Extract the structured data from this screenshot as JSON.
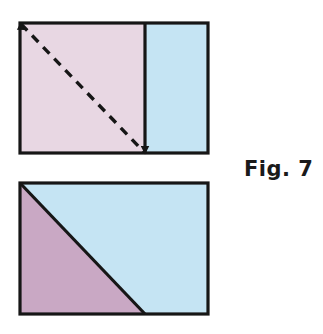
{
  "figure": {
    "label": "Fig. 7",
    "background_color": "#ffffff",
    "stroke_color": "#161616",
    "stroke_width": 3,
    "colors": {
      "light_pink": "#e8d7e3",
      "light_blue": "#c5e4f3",
      "mauve_purple": "#c9a8c4",
      "outline": "#161616"
    },
    "top_shape": {
      "name": "rectangle-with-dashed-diagonal",
      "x": 20,
      "y": 23,
      "width": 188,
      "height": 130,
      "divider_x": 145,
      "left_region_fill": "#e8d7e3",
      "right_region_fill": "#c5e4f3",
      "dashed_diagonal": {
        "x1": 20,
        "y1": 23,
        "x2": 145,
        "y2": 153,
        "dash_pattern": "9 7",
        "arrow_at": "start"
      },
      "divider_arrow_at": "end"
    },
    "bottom_shape": {
      "name": "rectangle-with-solid-diagonal",
      "x": 20,
      "y": 183,
      "width": 188,
      "height": 131,
      "diagonal": {
        "x1": 20,
        "y1": 183,
        "x2": 145,
        "y2": 314
      },
      "triangle_fill": "#c9a8c4",
      "remainder_fill": "#c5e4f3"
    }
  }
}
